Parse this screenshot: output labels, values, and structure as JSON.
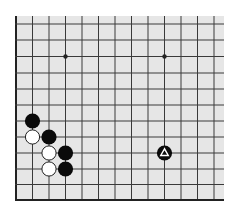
{
  "diagram": {
    "type": "go-board-fragment",
    "colors": {
      "page_bg": "#ffffff",
      "board_bg": "#e6e6e6",
      "grid_line": "#3a3a3a",
      "edge_line": "#222222",
      "black_stone": "#0a0a0a",
      "white_stone": "#ffffff",
      "white_stone_outline": "#222222",
      "marker": "#ffffff"
    },
    "board_area": {
      "x": 16,
      "y": 16,
      "width": 208,
      "height": 185
    },
    "grid": {
      "columns": 13,
      "rows": 12,
      "col_x": [
        16,
        32.5,
        49,
        65.5,
        82,
        98.5,
        115,
        131.5,
        148,
        164.5,
        181,
        197.5,
        214
      ],
      "row_y": [
        24,
        40,
        56.5,
        73,
        89,
        105,
        121,
        137,
        153,
        169,
        184.5,
        200
      ],
      "left_edge": true,
      "bottom_edge": true,
      "top_edge": false,
      "right_edge": false
    },
    "star_points": [
      {
        "col": 3,
        "row": 2
      },
      {
        "col": 9,
        "row": 2
      }
    ],
    "stones": [
      {
        "color": "black",
        "col": 1,
        "row": 6
      },
      {
        "color": "white",
        "col": 1,
        "row": 7
      },
      {
        "color": "black",
        "col": 2,
        "row": 7
      },
      {
        "color": "white",
        "col": 2,
        "row": 8
      },
      {
        "color": "black",
        "col": 3,
        "row": 8
      },
      {
        "color": "white",
        "col": 2,
        "row": 9
      },
      {
        "color": "black",
        "col": 3,
        "row": 9
      },
      {
        "color": "black",
        "col": 9,
        "row": 8,
        "marker": "triangle"
      }
    ],
    "stone_radius": 7.6
  }
}
